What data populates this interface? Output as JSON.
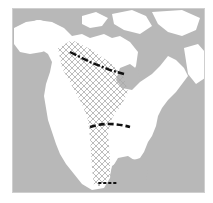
{
  "map": {
    "region": "North America",
    "colors": {
      "water": "#b8b8b8",
      "land": "#ffffff",
      "hatch": "#a8a8a8",
      "lines": "#111111",
      "frame_border": "#cfcfcf"
    },
    "features": [
      {
        "name": "range-hatched-area",
        "style": "cross-hatch"
      },
      {
        "name": "northern-boundary-line",
        "style": "dash-dot"
      },
      {
        "name": "central-boundary-line",
        "style": "dashed"
      },
      {
        "name": "southern-boundary-line",
        "style": "dotted"
      }
    ]
  }
}
